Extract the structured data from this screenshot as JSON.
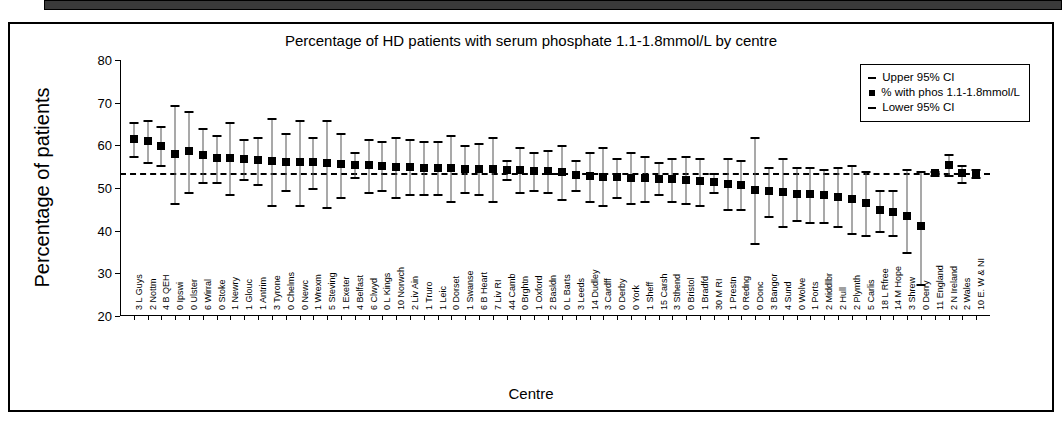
{
  "chart_data": {
    "type": "scatter",
    "title": "Percentage of HD patients with serum phosphate 1.1-1.8mmol/L by centre",
    "xlabel": "Centre",
    "ylabel": "Percentage of patients",
    "ylim": [
      20,
      80
    ],
    "yticks": [
      20,
      30,
      40,
      50,
      60,
      70,
      80
    ],
    "grid": false,
    "legend_position": "top-right",
    "reference_line": {
      "value": 53.5,
      "style": "dashed",
      "label": ""
    },
    "legend": [
      {
        "label": "Upper 95% CI",
        "marker": "dash"
      },
      {
        "label": "% with phos 1.1-1.8mmol/L",
        "marker": "square"
      },
      {
        "label": "Lower 95% CI",
        "marker": "dash"
      }
    ],
    "categories": [
      "3 L Guys",
      "2 Nottm",
      "4 B QEH",
      "0 Ipswi",
      "0 Ulster",
      "6 Wirral",
      "0 Stoke",
      "1 Newry",
      "1 Glouc",
      "1 Antrim",
      "3 Tyrone",
      "0 Chelms",
      "0 Newc",
      "1 Wrexm",
      "5 Steving",
      "1 Exeter",
      "4 Belfast",
      "6 Clwyd",
      "0 L Kings",
      "10 Norwch",
      "2 Liv Ain",
      "1 Truro",
      "1 Leic",
      "0 Dorset",
      "1 Swanse",
      "6 B Heart",
      "7 Liv RI",
      "44 Camb",
      "0 Brghtn",
      "1 Oxford",
      "2 Basldn",
      "0 L Barts",
      "3 Leeds",
      "14 Dudley",
      "3 Cardff",
      "0 Derby",
      "0 York",
      "1 Sheff",
      "15 Carsh",
      "3 Sthend",
      "0 Bristol",
      "1 Bradfd",
      "30 M RI",
      "1 Prestn",
      "0 Redng",
      "0 Donc",
      "3 Bangor",
      "4 Sund",
      "0 Wolve",
      "1 Ports",
      "2 Middlbr",
      "2 Hull",
      "2 Plymth",
      "5 Carlis",
      "18 L Rfree",
      "14 M Hope",
      "3 Shrew",
      "0 Derry",
      "11 England",
      "2 N Ireland",
      "2 Wales",
      "10 E. W & NI"
    ],
    "values": [
      61.5,
      61.0,
      59.8,
      58.0,
      58.7,
      57.8,
      57.0,
      57.0,
      56.8,
      56.5,
      56.4,
      56.2,
      56.0,
      56.0,
      55.8,
      55.6,
      55.5,
      55.3,
      55.2,
      55.0,
      54.9,
      54.8,
      54.7,
      54.6,
      54.5,
      54.4,
      54.4,
      54.3,
      54.2,
      54.0,
      53.9,
      53.7,
      53.0,
      52.8,
      52.6,
      52.5,
      52.4,
      52.3,
      52.2,
      52.0,
      51.8,
      51.6,
      51.3,
      51.0,
      50.8,
      49.5,
      49.3,
      49.0,
      48.7,
      48.5,
      48.3,
      48.0,
      47.5,
      46.5,
      44.8,
      44.3,
      43.5,
      41.0,
      53.5,
      55.5,
      53.5,
      53.5
    ],
    "upper_ci": [
      65.5,
      66.0,
      64.5,
      69.5,
      68.0,
      64.0,
      62.5,
      65.5,
      61.5,
      62.0,
      66.5,
      63.0,
      66.0,
      62.0,
      66.0,
      63.0,
      58.5,
      61.5,
      61.0,
      62.0,
      61.5,
      61.0,
      61.0,
      62.5,
      60.0,
      60.5,
      62.0,
      56.5,
      59.5,
      58.5,
      59.0,
      60.0,
      56.5,
      58.5,
      59.5,
      57.0,
      58.5,
      57.5,
      56.0,
      57.0,
      57.5,
      57.0,
      53.5,
      57.0,
      56.5,
      62.0,
      55.0,
      57.0,
      55.0,
      55.0,
      54.5,
      55.0,
      55.5,
      54.0,
      49.5,
      49.5,
      54.5,
      54.0,
      54.0,
      58.0,
      55.5,
      54.5
    ],
    "lower_ci": [
      57.5,
      56.0,
      55.5,
      46.5,
      49.0,
      51.5,
      51.5,
      48.5,
      52.0,
      51.0,
      46.0,
      49.5,
      46.0,
      50.0,
      45.5,
      48.0,
      52.5,
      49.0,
      49.5,
      48.0,
      48.5,
      48.5,
      48.5,
      47.0,
      49.0,
      48.5,
      47.0,
      52.0,
      49.0,
      49.5,
      49.0,
      47.5,
      49.5,
      47.0,
      46.0,
      48.0,
      46.5,
      47.0,
      48.5,
      47.0,
      46.5,
      46.0,
      49.0,
      45.0,
      45.0,
      37.0,
      43.5,
      41.0,
      42.5,
      42.0,
      42.0,
      41.0,
      39.5,
      39.0,
      40.0,
      39.0,
      35.0,
      27.5,
      53.0,
      53.0,
      51.5,
      52.5
    ]
  }
}
